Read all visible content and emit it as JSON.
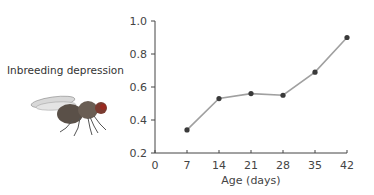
{
  "chart_data": {
    "type": "line",
    "title": "",
    "xlabel": "Age (days)",
    "ylabel": "Inbreeding depression",
    "x": [
      7,
      14,
      21,
      28,
      35,
      42
    ],
    "series": [
      {
        "name": "Inbreeding depression",
        "values": [
          0.34,
          0.53,
          0.56,
          0.55,
          0.69,
          0.9
        ]
      }
    ],
    "xlim": [
      0,
      42
    ],
    "ylim": [
      0.2,
      1.0
    ],
    "xticks": [
      "0",
      "7",
      "14",
      "21",
      "28",
      "35",
      "42"
    ],
    "yticks": [
      "0.2",
      "0.4",
      "0.6",
      "0.8",
      "1.0"
    ],
    "grid": false,
    "legend": "none",
    "line_color": "#a0a0a0",
    "marker_color": "#3a3a3a"
  },
  "labels": {
    "ylabel": "Inbreeding depression",
    "xlabel": "Age (days)"
  },
  "illustration": "fruit-fly"
}
